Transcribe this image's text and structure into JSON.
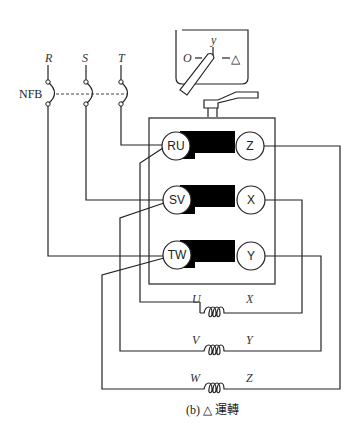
{
  "diagram": {
    "caption": "(b) △ 運轉",
    "supply": {
      "phases": [
        "R",
        "S",
        "T"
      ],
      "breaker_label": "NFB"
    },
    "switch": {
      "positions": [
        "O",
        "y",
        "△"
      ],
      "pos_off": "O",
      "pos_star": "y",
      "pos_delta": "△"
    },
    "terminals": {
      "left": [
        "RU",
        "SV",
        "TW"
      ],
      "right": [
        "Z",
        "X",
        "Y"
      ]
    },
    "windings": [
      {
        "start": "U",
        "end": "X"
      },
      {
        "start": "V",
        "end": "Y"
      },
      {
        "start": "W",
        "end": "Z"
      }
    ]
  }
}
